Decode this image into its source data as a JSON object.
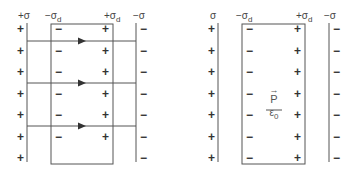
{
  "left_diagram": {
    "labels": {
      "plate_left": "+σ",
      "dielectric_left": "−σ",
      "dielectric_left_sub": "d",
      "dielectric_right": "+σ",
      "dielectric_right_sub": "d",
      "plate_right": "−σ"
    },
    "plate_left_signs": [
      "+",
      "+",
      "+",
      "+",
      "+",
      "+",
      "+"
    ],
    "dielectric_left_signs": [
      "−",
      "−",
      "−",
      "−",
      "−",
      "−"
    ],
    "dielectric_right_signs": [
      "+",
      "+",
      "+",
      "+",
      "+",
      "+"
    ],
    "plate_right_signs": [
      "−",
      "−",
      "−",
      "−",
      "−",
      "−",
      "−"
    ],
    "field_lines": 3
  },
  "right_diagram": {
    "labels": {
      "plate_left": "σ",
      "dielectric_left": "−σ",
      "dielectric_left_sub": "d",
      "dielectric_right": "+σ",
      "dielectric_right_sub": "d",
      "plate_right": "−σ"
    },
    "plate_left_signs": [
      "+",
      "+",
      "+",
      "+",
      "+",
      "+",
      "+"
    ],
    "dielectric_left_signs": [
      "−",
      "−",
      "−",
      "−",
      "−",
      "−",
      "−"
    ],
    "dielectric_right_signs": [
      "+",
      "+",
      "+",
      "+",
      "+",
      "+",
      "+"
    ],
    "plate_right_signs": [
      "−",
      "−",
      "−",
      "−",
      "−",
      "−",
      "−"
    ],
    "polarization": {
      "numerator": "P",
      "vector_arrow": "→",
      "denominator": "ε",
      "denominator_sub": "0"
    }
  }
}
